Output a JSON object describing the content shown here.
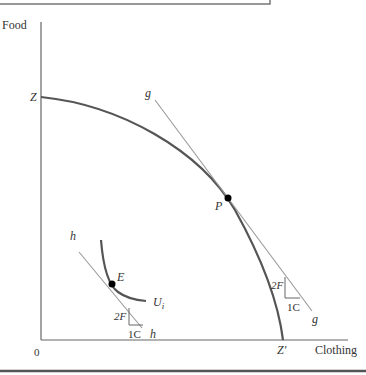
{
  "diagram": {
    "axes": {
      "y_label": "Food",
      "x_label": "Clothing",
      "origin_label": "0"
    },
    "ppf": {
      "start_label": "Z",
      "end_label": "Z′"
    },
    "tangent_g": {
      "label_top": "g",
      "label_bottom": "g",
      "point_label": "P",
      "rise_label": "2F",
      "run_label": "1C"
    },
    "tangent_h": {
      "label_top": "h",
      "label_bottom": "h",
      "point_label": "E",
      "rise_label": "2F",
      "run_label": "1C"
    },
    "indifference_curve": {
      "label": "U",
      "subscript": "i"
    },
    "colors": {
      "curve": "#555555",
      "tangent": "#999999",
      "axis": "#666666",
      "point": "#000000"
    }
  }
}
